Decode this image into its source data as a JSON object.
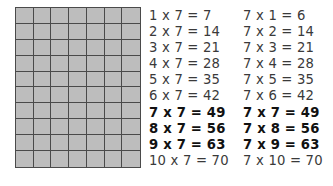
{
  "grid": {
    "columns": 7,
    "rows": 10,
    "fill_color": "#bdbdbd",
    "line_color": "#4a4a4a"
  },
  "left_column": [
    {
      "text": "1 x 7 = 7",
      "bold": false
    },
    {
      "text": "2 x 7 = 14",
      "bold": false
    },
    {
      "text": "3 x 7 = 21",
      "bold": false
    },
    {
      "text": "4 x 7 = 28",
      "bold": false
    },
    {
      "text": "5 x 7 = 35",
      "bold": false
    },
    {
      "text": "6 x 7 = 42",
      "bold": false
    },
    {
      "text": "7 x 7 = 49",
      "bold": true
    },
    {
      "text": "8 x 7 = 56",
      "bold": true
    },
    {
      "text": "9 x 7 = 63",
      "bold": true
    },
    {
      "text": "10 x 7 = 70",
      "bold": false
    }
  ],
  "right_column": [
    {
      "text": "7 x 1 = 6",
      "bold": false
    },
    {
      "text": "7 x 2 = 14",
      "bold": false
    },
    {
      "text": "7 x 3 = 21",
      "bold": false
    },
    {
      "text": "7 x 4 = 28",
      "bold": false
    },
    {
      "text": "7 x 5 = 35",
      "bold": false
    },
    {
      "text": "7 x 6 = 42",
      "bold": false
    },
    {
      "text": "7 x 7 = 49",
      "bold": true
    },
    {
      "text": "7 x 8 = 56",
      "bold": true
    },
    {
      "text": "7 x 9 = 63",
      "bold": true
    },
    {
      "text": "7 x 10 = 70",
      "bold": false
    }
  ]
}
